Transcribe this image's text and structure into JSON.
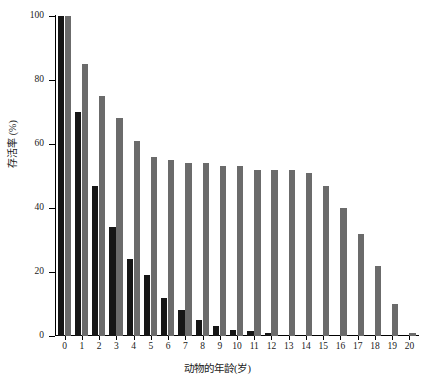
{
  "chart_data": {
    "type": "bar",
    "title": "",
    "subtitle": "",
    "xlabel": "动物的年龄(岁)",
    "ylabel": "存活率 (%)",
    "xlim": [
      -0.5,
      20.5
    ],
    "ylim": [
      0,
      100
    ],
    "grid": false,
    "legend_position": "none",
    "y_ticks": [
      0,
      20,
      40,
      60,
      80,
      100
    ],
    "y_tick_labels": [
      "0",
      "20",
      "40",
      "60",
      "80",
      "100"
    ],
    "categories": [
      "0",
      "1",
      "2",
      "3",
      "4",
      "5",
      "6",
      "7",
      "8",
      "9",
      "10",
      "11",
      "12",
      "13",
      "14",
      "15",
      "16",
      "17",
      "18",
      "19",
      "20"
    ],
    "series": [
      {
        "name": "dark-series",
        "color": "#161616",
        "values": [
          100,
          70,
          47,
          34,
          24,
          19,
          12,
          8,
          5,
          3,
          2,
          1.5,
          1,
          0,
          0,
          0,
          0,
          0,
          0,
          0,
          0
        ]
      },
      {
        "name": "gray-series",
        "color": "#6b6b6b",
        "values": [
          100,
          85,
          75,
          68,
          61,
          56,
          55,
          54,
          54,
          53,
          53,
          52,
          52,
          52,
          51,
          47,
          40,
          32,
          22,
          10,
          1
        ]
      }
    ]
  },
  "axes": {
    "y_title": "存活率 (%)",
    "x_title": "动物的年龄(岁)"
  }
}
